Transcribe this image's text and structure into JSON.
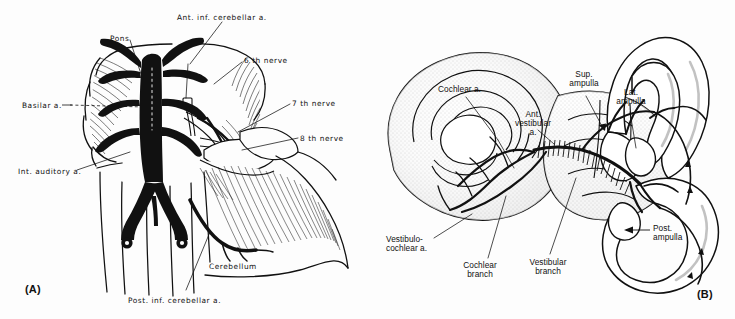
{
  "figure": {
    "background_color": "#fdfdfd",
    "ink_color": "#111111",
    "panel_count": 2
  },
  "panel_a": {
    "tag": "(A)",
    "subject": "Brainstem, pons and cerebellum with basilar artery and cranial nerves",
    "labels": [
      {
        "id": "ant-inf-cerebellar-a",
        "text": "Ant. inf. cerebellar a.",
        "x": 177,
        "y": 14,
        "align": "left"
      },
      {
        "id": "pons",
        "text": "Pons",
        "x": 110,
        "y": 35,
        "align": "left"
      },
      {
        "id": "sixth-nerve",
        "text": "6 th nerve",
        "x": 244,
        "y": 57,
        "align": "left"
      },
      {
        "id": "basilar-a",
        "text": "Basilar a.",
        "x": 22,
        "y": 102,
        "align": "left"
      },
      {
        "id": "seventh-nerve",
        "text": "7 th nerve",
        "x": 292,
        "y": 100,
        "align": "left"
      },
      {
        "id": "eighth-nerve",
        "text": "8 th nerve",
        "x": 300,
        "y": 135,
        "align": "left"
      },
      {
        "id": "int-auditory-a",
        "text": "Int. auditory a.",
        "x": 18,
        "y": 168,
        "align": "left"
      },
      {
        "id": "cerebellum",
        "text": "Cerebellum",
        "x": 209,
        "y": 263,
        "align": "left"
      },
      {
        "id": "post-inf-cerebellar-a",
        "text": "Post. inf. cerebellar a.",
        "x": 128,
        "y": 297,
        "align": "left"
      }
    ]
  },
  "panel_b": {
    "tag": "(B)",
    "subject": "Membranous labyrinth: cochlea and semicircular canals with labyrinthine arterial supply",
    "labels": [
      {
        "id": "cochlear-a",
        "text": "Cochlear a.",
        "x": 438,
        "y": 85,
        "align": "left"
      },
      {
        "id": "sup-ampulla",
        "text": "Sup.\nampulla",
        "x": 569,
        "y": 70,
        "align": "center"
      },
      {
        "id": "lat-ampulla",
        "text": "Lat.\nampulla",
        "x": 615,
        "y": 88,
        "align": "center"
      },
      {
        "id": "ant-vestibular-a",
        "text": "Ant.\nvestibular\na.",
        "x": 521,
        "y": 110,
        "align": "center"
      },
      {
        "id": "post-ampulla",
        "text": "Post.\nampulla",
        "x": 653,
        "y": 224,
        "align": "left"
      },
      {
        "id": "vestibulocochlear-a",
        "text": "Vestibulo-\ncochlear a.",
        "x": 386,
        "y": 235,
        "align": "left"
      },
      {
        "id": "cochlear-branch",
        "text": "Cochlear\nbranch",
        "x": 473,
        "y": 261,
        "align": "center"
      },
      {
        "id": "vestibular-branch",
        "text": "Vestibular\nbranch",
        "x": 535,
        "y": 258,
        "align": "center"
      }
    ]
  }
}
